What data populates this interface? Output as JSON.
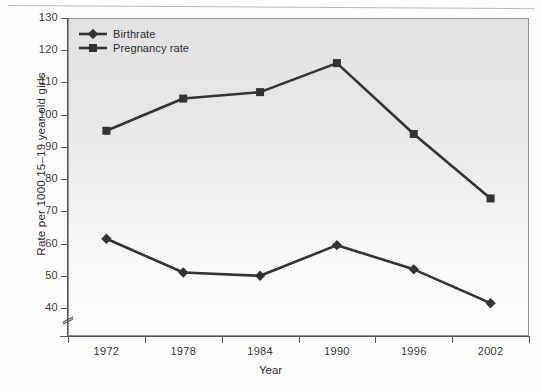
{
  "chart_data": {
    "type": "line",
    "title": "",
    "xlabel": "Year",
    "ylabel": "Rate per 1000 15–19 year old girls",
    "categories": [
      "1972",
      "1978",
      "1984",
      "1990",
      "1996",
      "2002"
    ],
    "ylim": [
      40,
      130
    ],
    "y_ticks": [
      130,
      120,
      110,
      100,
      90,
      80,
      70,
      60,
      50,
      40
    ],
    "y_axis_break": true,
    "grid": false,
    "legend_position": "top-left",
    "series": [
      {
        "name": "Birthrate",
        "marker": "diamond",
        "color": "#333333",
        "values": [
          61.5,
          51,
          50,
          59.5,
          52,
          41.5
        ]
      },
      {
        "name": "Pregnancy rate",
        "marker": "square",
        "color": "#333333",
        "values": [
          95,
          105,
          107,
          116,
          94,
          74
        ]
      }
    ]
  },
  "axis": {
    "y_title": "Rate per 1000 15–19 year old girls",
    "x_title": "Year",
    "y_tick_labels": [
      "130",
      "120",
      "110",
      "100",
      "90",
      "80",
      "70",
      "60",
      "50",
      "40"
    ],
    "x_tick_labels": [
      "1972",
      "1978",
      "1984",
      "1990",
      "1996",
      "2002"
    ]
  },
  "legend": {
    "items": [
      {
        "label": "Birthrate",
        "marker": "diamond-marker"
      },
      {
        "label": "Pregnancy rate",
        "marker": "square-marker"
      }
    ]
  },
  "colors": {
    "series": "#333333",
    "plot_background": "#e8e8e8",
    "axis": "#555555",
    "text": "#2b2b2b"
  }
}
